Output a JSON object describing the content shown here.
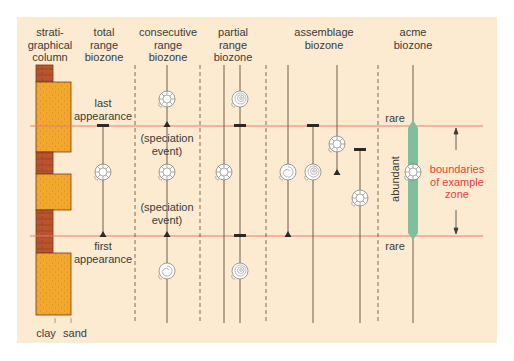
{
  "headers": {
    "strat_column": "strati-\ngraphical\ncolumn",
    "total_range": "total\nrange\nbiozone",
    "consecutive_range": "consecutive\nrange\nbiozone",
    "partial_range": "partial\nrange\nbiozone",
    "assemblage": "assemblage\nbiozone",
    "acme": "acme\nbiozone"
  },
  "labels": {
    "last_appearance": "last\nappearance",
    "first_appearance": "first\nappearance",
    "speciation_event_1": "(speciation\nevent)",
    "speciation_event_2": "(speciation\nevent)",
    "rare_top": "rare",
    "rare_bottom": "rare",
    "abundant": "abundant",
    "boundaries": "boundaries\nof example\nzone",
    "clay": "clay",
    "sand": "sand"
  },
  "colors": {
    "background": "#fcebd0",
    "sand": "#f2a72e",
    "clay": "#b8552e",
    "boundary_line": "#e8413c",
    "acme_bar": "#7fbf9c",
    "line": "#4a3a30"
  },
  "icons": [
    "ammonite-ribbed-icon",
    "ammonite-spiral-icon",
    "ammonite-smooth-icon"
  ]
}
